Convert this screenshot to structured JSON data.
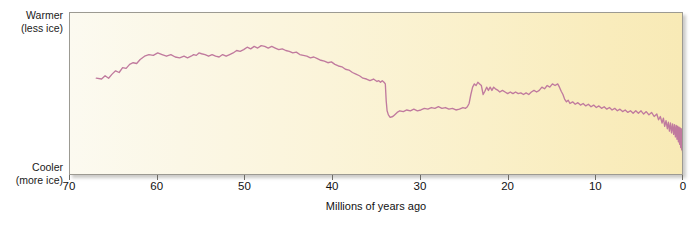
{
  "figure": {
    "axes": {
      "y": {
        "top_label_line1": "Warmer",
        "top_label_line2": "(less ice)",
        "bottom_label_line1": "Cooler",
        "bottom_label_line2": "(more ice)"
      },
      "x": {
        "title": "Millions of years ago",
        "ticks": [
          70,
          60,
          50,
          40,
          30,
          20,
          10,
          0
        ]
      }
    },
    "colors": {
      "curve": "#c07a9e",
      "frame": "#9c9a92",
      "bg_left": "#fcfaf0",
      "bg_right": "#f8eab6",
      "text": "#121212"
    }
  },
  "chart_data": {
    "type": "line",
    "title": "",
    "subtitle": "",
    "xlabel": "Millions of years ago",
    "ylabel": "",
    "ylabel_top": "Warmer (less ice)",
    "ylabel_bottom": "Cooler (more ice)",
    "xlim": [
      70,
      0
    ],
    "x_reversed": true,
    "ylim": [
      0,
      1
    ],
    "y_axis_ticks_shown": false,
    "grid": false,
    "legend": null,
    "xticks": [
      70,
      60,
      50,
      40,
      30,
      20,
      10,
      0
    ],
    "series": [
      {
        "name": "Cenozoic deep-sea temperature / ice volume proxy",
        "comment": "x = millions of years ago; y = relative warmth, 1.00 = warmest (top of plot), 0.00 = coolest (bottom of plot)",
        "points": [
          [
            67.0,
            0.6
          ],
          [
            66.4,
            0.595
          ],
          [
            66.0,
            0.615
          ],
          [
            65.6,
            0.6
          ],
          [
            65.2,
            0.625
          ],
          [
            64.8,
            0.645
          ],
          [
            64.4,
            0.635
          ],
          [
            64.0,
            0.665
          ],
          [
            63.6,
            0.66
          ],
          [
            63.2,
            0.685
          ],
          [
            62.8,
            0.695
          ],
          [
            62.4,
            0.69
          ],
          [
            62.0,
            0.715
          ],
          [
            61.5,
            0.735
          ],
          [
            61.0,
            0.745
          ],
          [
            60.5,
            0.74
          ],
          [
            60.0,
            0.755
          ],
          [
            59.5,
            0.745
          ],
          [
            59.0,
            0.735
          ],
          [
            58.5,
            0.745
          ],
          [
            58.0,
            0.73
          ],
          [
            57.5,
            0.725
          ],
          [
            57.0,
            0.735
          ],
          [
            56.6,
            0.725
          ],
          [
            56.2,
            0.735
          ],
          [
            55.9,
            0.745
          ],
          [
            55.6,
            0.74
          ],
          [
            55.3,
            0.755
          ],
          [
            55.0,
            0.75
          ],
          [
            54.6,
            0.745
          ],
          [
            54.2,
            0.735
          ],
          [
            53.8,
            0.745
          ],
          [
            53.4,
            0.735
          ],
          [
            53.0,
            0.73
          ],
          [
            52.6,
            0.745
          ],
          [
            52.2,
            0.735
          ],
          [
            51.8,
            0.745
          ],
          [
            51.4,
            0.755
          ],
          [
            51.0,
            0.77
          ],
          [
            50.6,
            0.765
          ],
          [
            50.2,
            0.775
          ],
          [
            49.8,
            0.79
          ],
          [
            49.4,
            0.78
          ],
          [
            49.0,
            0.795
          ],
          [
            48.6,
            0.785
          ],
          [
            48.2,
            0.8
          ],
          [
            47.8,
            0.795
          ],
          [
            47.4,
            0.785
          ],
          [
            47.0,
            0.795
          ],
          [
            46.6,
            0.785
          ],
          [
            46.2,
            0.775
          ],
          [
            45.8,
            0.78
          ],
          [
            45.4,
            0.77
          ],
          [
            45.0,
            0.765
          ],
          [
            44.6,
            0.755
          ],
          [
            44.2,
            0.76
          ],
          [
            43.8,
            0.745
          ],
          [
            43.4,
            0.74
          ],
          [
            43.0,
            0.735
          ],
          [
            42.6,
            0.725
          ],
          [
            42.2,
            0.73
          ],
          [
            41.8,
            0.72
          ],
          [
            41.4,
            0.71
          ],
          [
            41.0,
            0.705
          ],
          [
            40.6,
            0.695
          ],
          [
            40.2,
            0.7
          ],
          [
            39.8,
            0.685
          ],
          [
            39.4,
            0.675
          ],
          [
            39.0,
            0.67
          ],
          [
            38.6,
            0.655
          ],
          [
            38.2,
            0.65
          ],
          [
            37.8,
            0.635
          ],
          [
            37.4,
            0.625
          ],
          [
            37.0,
            0.615
          ],
          [
            36.6,
            0.6
          ],
          [
            36.2,
            0.595
          ],
          [
            35.8,
            0.585
          ],
          [
            35.4,
            0.595
          ],
          [
            35.0,
            0.58
          ],
          [
            34.8,
            0.585
          ],
          [
            34.6,
            0.575
          ],
          [
            34.4,
            0.585
          ],
          [
            34.2,
            0.575
          ],
          [
            34.05,
            0.565
          ],
          [
            33.95,
            0.46
          ],
          [
            33.85,
            0.4
          ],
          [
            33.7,
            0.375
          ],
          [
            33.5,
            0.36
          ],
          [
            33.2,
            0.365
          ],
          [
            33.0,
            0.375
          ],
          [
            32.7,
            0.39
          ],
          [
            32.4,
            0.4
          ],
          [
            32.0,
            0.395
          ],
          [
            31.6,
            0.405
          ],
          [
            31.2,
            0.4
          ],
          [
            30.8,
            0.41
          ],
          [
            30.4,
            0.4
          ],
          [
            30.0,
            0.405
          ],
          [
            29.6,
            0.415
          ],
          [
            29.2,
            0.41
          ],
          [
            28.8,
            0.42
          ],
          [
            28.4,
            0.415
          ],
          [
            28.0,
            0.425
          ],
          [
            27.6,
            0.415
          ],
          [
            27.2,
            0.42
          ],
          [
            26.8,
            0.41
          ],
          [
            26.4,
            0.415
          ],
          [
            26.0,
            0.405
          ],
          [
            25.6,
            0.41
          ],
          [
            25.2,
            0.42
          ],
          [
            24.9,
            0.415
          ],
          [
            24.7,
            0.425
          ],
          [
            24.5,
            0.445
          ],
          [
            24.3,
            0.5
          ],
          [
            24.1,
            0.545
          ],
          [
            23.9,
            0.565
          ],
          [
            23.7,
            0.555
          ],
          [
            23.5,
            0.575
          ],
          [
            23.3,
            0.565
          ],
          [
            23.1,
            0.555
          ],
          [
            22.9,
            0.5
          ],
          [
            22.7,
            0.52
          ],
          [
            22.5,
            0.545
          ],
          [
            22.3,
            0.525
          ],
          [
            22.1,
            0.545
          ],
          [
            21.9,
            0.525
          ],
          [
            21.7,
            0.545
          ],
          [
            21.5,
            0.535
          ],
          [
            21.2,
            0.525
          ],
          [
            21.0,
            0.515
          ],
          [
            20.7,
            0.525
          ],
          [
            20.4,
            0.515
          ],
          [
            20.1,
            0.505
          ],
          [
            19.8,
            0.515
          ],
          [
            19.5,
            0.505
          ],
          [
            19.2,
            0.515
          ],
          [
            18.9,
            0.505
          ],
          [
            18.6,
            0.51
          ],
          [
            18.3,
            0.5
          ],
          [
            18.0,
            0.51
          ],
          [
            17.7,
            0.5
          ],
          [
            17.4,
            0.515
          ],
          [
            17.1,
            0.525
          ],
          [
            16.8,
            0.515
          ],
          [
            16.5,
            0.525
          ],
          [
            16.2,
            0.545
          ],
          [
            15.9,
            0.535
          ],
          [
            15.6,
            0.555
          ],
          [
            15.3,
            0.545
          ],
          [
            15.0,
            0.565
          ],
          [
            14.7,
            0.555
          ],
          [
            14.4,
            0.565
          ],
          [
            14.2,
            0.545
          ],
          [
            14.0,
            0.52
          ],
          [
            13.8,
            0.5
          ],
          [
            13.6,
            0.47
          ],
          [
            13.4,
            0.455
          ],
          [
            13.2,
            0.465
          ],
          [
            13.0,
            0.445
          ],
          [
            12.7,
            0.455
          ],
          [
            12.4,
            0.44
          ],
          [
            12.1,
            0.45
          ],
          [
            11.8,
            0.435
          ],
          [
            11.5,
            0.445
          ],
          [
            11.2,
            0.43
          ],
          [
            10.9,
            0.44
          ],
          [
            10.6,
            0.425
          ],
          [
            10.3,
            0.435
          ],
          [
            10.0,
            0.42
          ],
          [
            9.7,
            0.43
          ],
          [
            9.4,
            0.415
          ],
          [
            9.1,
            0.425
          ],
          [
            8.8,
            0.41
          ],
          [
            8.5,
            0.42
          ],
          [
            8.2,
            0.405
          ],
          [
            7.9,
            0.415
          ],
          [
            7.6,
            0.4
          ],
          [
            7.3,
            0.41
          ],
          [
            7.0,
            0.395
          ],
          [
            6.7,
            0.405
          ],
          [
            6.4,
            0.39
          ],
          [
            6.1,
            0.4
          ],
          [
            5.8,
            0.385
          ],
          [
            5.5,
            0.4
          ],
          [
            5.2,
            0.385
          ],
          [
            4.9,
            0.4
          ],
          [
            4.6,
            0.38
          ],
          [
            4.3,
            0.395
          ],
          [
            4.0,
            0.375
          ],
          [
            3.7,
            0.39
          ],
          [
            3.4,
            0.365
          ],
          [
            3.1,
            0.38
          ],
          [
            2.9,
            0.345
          ],
          [
            2.7,
            0.365
          ],
          [
            2.5,
            0.325
          ],
          [
            2.35,
            0.355
          ],
          [
            2.2,
            0.305
          ],
          [
            2.05,
            0.34
          ],
          [
            1.9,
            0.29
          ],
          [
            1.78,
            0.33
          ],
          [
            1.66,
            0.275
          ],
          [
            1.54,
            0.325
          ],
          [
            1.42,
            0.265
          ],
          [
            1.3,
            0.32
          ],
          [
            1.18,
            0.255
          ],
          [
            1.08,
            0.315
          ],
          [
            0.98,
            0.24
          ],
          [
            0.88,
            0.31
          ],
          [
            0.8,
            0.225
          ],
          [
            0.72,
            0.305
          ],
          [
            0.64,
            0.21
          ],
          [
            0.57,
            0.3
          ],
          [
            0.5,
            0.195
          ],
          [
            0.44,
            0.295
          ],
          [
            0.38,
            0.175
          ],
          [
            0.32,
            0.29
          ],
          [
            0.26,
            0.16
          ],
          [
            0.21,
            0.285
          ],
          [
            0.16,
            0.145
          ],
          [
            0.12,
            0.28
          ],
          [
            0.08,
            0.13
          ],
          [
            0.04,
            0.27
          ],
          [
            0.015,
            0.125
          ],
          [
            0.0,
            0.255
          ]
        ]
      }
    ],
    "annotations": [
      {
        "x": 49.0,
        "label": "Early Eocene Climatic Optimum (warmest)"
      },
      {
        "x": 34.0,
        "label": "Abrupt Eocene-Oligocene cooling step"
      },
      {
        "x": 15.5,
        "label": "Mid-Miocene Climatic Optimum"
      },
      {
        "x": 1.0,
        "label": "Pleistocene glacial-interglacial cycles"
      }
    ]
  }
}
